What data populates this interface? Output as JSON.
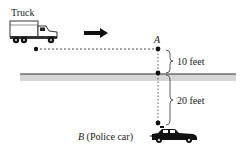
{
  "labels": {
    "truck": "Truck",
    "point_a": "A",
    "point_b_letter": "B",
    "point_b_desc": "(Police car)",
    "dist_top": "10 feet",
    "dist_bottom": "20 feet"
  },
  "colors": {
    "ink": "#111111",
    "road_band": "#d4d4d4",
    "road_line": "#333333"
  }
}
